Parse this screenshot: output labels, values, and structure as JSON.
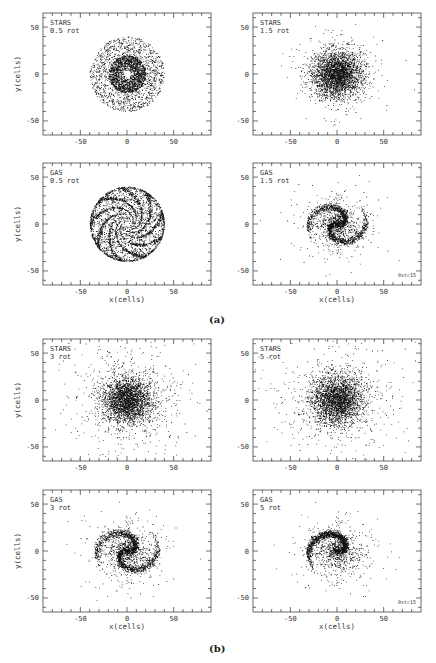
{
  "captions": {
    "a": "(a)",
    "b": "(b)"
  },
  "chart_data": [
    {
      "type": "scatter",
      "group": "a",
      "component": "STARS",
      "time": "0.5 rot",
      "xlabel": "",
      "ylabel": "y(cells)",
      "xlim": [
        -90,
        90
      ],
      "ylim": [
        -65,
        65
      ],
      "xticks": [
        "-50",
        "0",
        "50"
      ],
      "yticks": [
        "-50",
        "0",
        "50"
      ],
      "morphology": "ring disk with dense inner disk and central hole",
      "distribution": {
        "inner_radius": 3,
        "outer_radius": 40,
        "core_radius": 20,
        "center": [
          0,
          0
        ],
        "spiral_arms": 0
      },
      "run_id": ""
    },
    {
      "type": "scatter",
      "group": "a",
      "component": "STARS",
      "time": "1.5 rot",
      "xlabel": "",
      "ylabel": "",
      "xlim": [
        -90,
        90
      ],
      "ylim": [
        -65,
        65
      ],
      "xticks": [
        "-50",
        "0",
        "50"
      ],
      "yticks": [
        "-50",
        "0",
        "50"
      ],
      "morphology": "dense compact disk",
      "distribution": {
        "inner_radius": 0,
        "outer_radius": 35,
        "core_radius": 25,
        "center": [
          0,
          0
        ],
        "spiral_arms": 0
      },
      "run_id": ""
    },
    {
      "type": "scatter",
      "group": "a",
      "component": "GAS",
      "time": "0.5 rot",
      "xlabel": "x(cells)",
      "ylabel": "y(cells)",
      "xlim": [
        -90,
        90
      ],
      "ylim": [
        -65,
        65
      ],
      "xticks": [
        "-50",
        "0",
        "50"
      ],
      "yticks": [
        "-50",
        "0",
        "50"
      ],
      "morphology": "multi-armed spiral disk with sharp outer edge",
      "distribution": {
        "inner_radius": 2,
        "outer_radius": 40,
        "core_radius": 0,
        "center": [
          0,
          0
        ],
        "spiral_arms": 9
      },
      "run_id": ""
    },
    {
      "type": "scatter",
      "group": "a",
      "component": "GAS",
      "time": "1.5 rot",
      "xlabel": "x(cells)",
      "ylabel": "",
      "xlim": [
        -90,
        90
      ],
      "ylim": [
        -65,
        65
      ],
      "xticks": [
        "-50",
        "0",
        "50"
      ],
      "yticks": [
        "-50",
        "0",
        "50"
      ],
      "morphology": "dense clumpy disk with ring structures",
      "distribution": {
        "inner_radius": 0,
        "outer_radius": 33,
        "core_radius": 22,
        "center": [
          0,
          0
        ],
        "spiral_arms": 2
      },
      "run_id": "0stc15"
    },
    {
      "type": "scatter",
      "group": "b",
      "component": "STARS",
      "time": "3 rot",
      "xlabel": "",
      "ylabel": "y(cells)",
      "xlim": [
        -90,
        90
      ],
      "ylim": [
        -65,
        65
      ],
      "xticks": [
        "-50",
        "0",
        "50"
      ],
      "yticks": [
        "-50",
        "0",
        "50"
      ],
      "morphology": "dense core with extended diffuse halo",
      "distribution": {
        "inner_radius": 0,
        "outer_radius": 55,
        "core_radius": 25,
        "center": [
          0,
          0
        ],
        "spiral_arms": 0
      },
      "run_id": ""
    },
    {
      "type": "scatter",
      "group": "b",
      "component": "STARS",
      "time": "5 rot",
      "xlabel": "",
      "ylabel": "",
      "xlim": [
        -90,
        90
      ],
      "ylim": [
        -65,
        65
      ],
      "xticks": [
        "-50",
        "0",
        "50"
      ],
      "yticks": [
        "-50",
        "0",
        "50"
      ],
      "morphology": "dense core with extended diffuse halo",
      "distribution": {
        "inner_radius": 0,
        "outer_radius": 60,
        "core_radius": 27,
        "center": [
          0,
          0
        ],
        "spiral_arms": 0
      },
      "run_id": ""
    },
    {
      "type": "scatter",
      "group": "b",
      "component": "GAS",
      "time": "3 rot",
      "xlabel": "x(cells)",
      "ylabel": "y(cells)",
      "xlim": [
        -90,
        90
      ],
      "ylim": [
        -65,
        65
      ],
      "xticks": [
        "-50",
        "0",
        "50"
      ],
      "yticks": [
        "-50",
        "0",
        "50"
      ],
      "morphology": "elongated two-armed spiral",
      "distribution": {
        "inner_radius": 0,
        "outer_radius": 35,
        "core_radius": 25,
        "center": [
          0,
          0
        ],
        "spiral_arms": 2
      },
      "run_id": ""
    },
    {
      "type": "scatter",
      "group": "b",
      "component": "GAS",
      "time": "5 rot",
      "xlabel": "x(cells)",
      "ylabel": "",
      "xlim": [
        -90,
        90
      ],
      "ylim": [
        -65,
        65
      ],
      "xticks": [
        "-50",
        "0",
        "50"
      ],
      "yticks": [
        "-50",
        "0",
        "50"
      ],
      "morphology": "lopsided spiral with one dominant arm",
      "distribution": {
        "inner_radius": 0,
        "outer_radius": 33,
        "core_radius": 25,
        "center": [
          0,
          0
        ],
        "spiral_arms": 1
      },
      "run_id": "0stc15"
    }
  ]
}
